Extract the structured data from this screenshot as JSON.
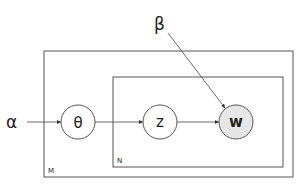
{
  "diagram": {
    "nodes": [
      {
        "id": "theta",
        "label": "θ",
        "observed": false
      },
      {
        "id": "z",
        "label": "z",
        "observed": false
      },
      {
        "id": "w",
        "label": "w",
        "observed": true
      }
    ],
    "hyperparameters": [
      {
        "id": "alpha",
        "label": "α"
      },
      {
        "id": "beta",
        "label": "β"
      }
    ],
    "plates": [
      {
        "id": "outer",
        "label": "M"
      },
      {
        "id": "inner",
        "label": "N"
      }
    ],
    "edges": [
      {
        "from": "alpha",
        "to": "theta"
      },
      {
        "from": "theta",
        "to": "z"
      },
      {
        "from": "z",
        "to": "w"
      },
      {
        "from": "beta",
        "to": "w"
      }
    ],
    "colors": {
      "stroke": "#444444",
      "observed_fill": "#e6e6e6",
      "node_fill": "#ffffff"
    }
  }
}
